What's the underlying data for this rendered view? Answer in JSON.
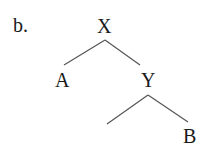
{
  "example_label": "b.",
  "tree": {
    "root": {
      "label": "X",
      "children": [
        {
          "label": "A"
        },
        {
          "label": "Y",
          "children": [
            {
              "label": ""
            },
            {
              "label": "B"
            }
          ]
        }
      ]
    }
  },
  "nodes": {
    "x": "X",
    "a": "A",
    "y": "Y",
    "b": "B"
  },
  "colors": {
    "text": "#1a1a1a",
    "edge": "#555555",
    "background": "#ffffff"
  }
}
